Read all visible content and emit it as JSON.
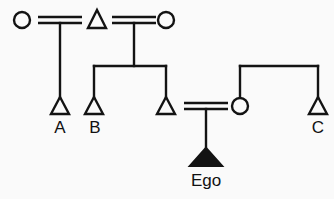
{
  "diagram": {
    "background_color": "#fafafa",
    "ink_color": "#131313",
    "width": 334,
    "height": 199,
    "labels": {
      "a": "A",
      "b": "B",
      "c": "C",
      "ego": "Ego"
    },
    "persons": [
      {
        "id": "p1",
        "symbol": "circle",
        "sex": "female",
        "filled": false,
        "generation": 1,
        "x": 22,
        "y": 20,
        "label": ""
      },
      {
        "id": "p2",
        "symbol": "triangle",
        "sex": "male",
        "filled": false,
        "generation": 1,
        "x": 97,
        "y": 20,
        "label": ""
      },
      {
        "id": "p3",
        "symbol": "circle",
        "sex": "female",
        "filled": false,
        "generation": 1,
        "x": 166,
        "y": 20,
        "label": ""
      },
      {
        "id": "p4",
        "symbol": "triangle",
        "sex": "male",
        "filled": false,
        "generation": 2,
        "x": 60,
        "y": 107,
        "label": "A"
      },
      {
        "id": "p5",
        "symbol": "triangle",
        "sex": "male",
        "filled": false,
        "generation": 2,
        "x": 94,
        "y": 107,
        "label": "B"
      },
      {
        "id": "p6",
        "symbol": "triangle",
        "sex": "male",
        "filled": false,
        "generation": 2,
        "x": 166,
        "y": 107,
        "label": ""
      },
      {
        "id": "p7",
        "symbol": "circle",
        "sex": "female",
        "filled": false,
        "generation": 2,
        "x": 240,
        "y": 106,
        "label": ""
      },
      {
        "id": "p8",
        "symbol": "triangle",
        "sex": "male",
        "filled": false,
        "generation": 2,
        "x": 318,
        "y": 107,
        "label": "C"
      },
      {
        "id": "p9",
        "symbol": "triangle",
        "sex": "male",
        "filled": true,
        "generation": 3,
        "x": 210,
        "y": 158,
        "label": "Ego"
      }
    ],
    "marriages": [
      {
        "id": "m1",
        "left": "p1",
        "right": "p2",
        "x1": 38,
        "x2": 82,
        "y": 20
      },
      {
        "id": "m2",
        "left": "p2",
        "right": "p3",
        "x1": 112,
        "x2": 156,
        "y": 20
      },
      {
        "id": "m3",
        "left": "p6",
        "right": "p7",
        "x1": 182,
        "x2": 228,
        "y": 106
      }
    ],
    "descent_groups": [
      {
        "id": "d1",
        "parent_marriage": "m1",
        "children": [
          "p4"
        ]
      },
      {
        "id": "d2",
        "parent_marriage": "m2",
        "children": [
          "p5",
          "p6"
        ]
      },
      {
        "id": "d3",
        "parent_marriage": "m3",
        "children": [
          "p9"
        ]
      },
      {
        "id": "d4",
        "parent_marriage": "",
        "children": [
          "p7",
          "p8"
        ]
      }
    ]
  }
}
